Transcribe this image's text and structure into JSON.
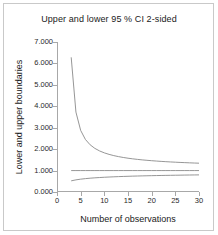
{
  "chart_data": {
    "type": "line",
    "title": "Upper and lower 95 % CI 2-sided",
    "xlabel": "Number of observations",
    "ylabel": "Lower and upper boundaries",
    "xlim": [
      0,
      30
    ],
    "ylim": [
      0,
      7
    ],
    "grid": false,
    "legend": "none",
    "xticks": [
      "0",
      "5",
      "10",
      "15",
      "20",
      "25",
      "30"
    ],
    "xtick_values": [
      0,
      5,
      10,
      15,
      20,
      25,
      30
    ],
    "yticks": [
      "0.000",
      "1.000",
      "2.000",
      "3.000",
      "4.000",
      "5.000",
      "6.000",
      "7.000"
    ],
    "ytick_values": [
      0,
      1,
      2,
      3,
      4,
      5,
      6,
      7
    ],
    "line_color": "#8a8a8a",
    "axis_color": "#a8a8a8",
    "x": [
      3,
      4,
      5,
      6,
      7,
      8,
      9,
      10,
      11,
      12,
      13,
      14,
      15,
      16,
      17,
      18,
      19,
      20,
      21,
      22,
      23,
      24,
      25,
      26,
      27,
      28,
      29,
      30
    ],
    "series": [
      {
        "name": "Upper boundary",
        "values": [
          6.285,
          3.729,
          2.874,
          2.453,
          2.202,
          2.035,
          1.916,
          1.826,
          1.755,
          1.698,
          1.651,
          1.611,
          1.577,
          1.548,
          1.522,
          1.499,
          1.479,
          1.461,
          1.444,
          1.429,
          1.415,
          1.403,
          1.391,
          1.38,
          1.37,
          1.361,
          1.352,
          1.344
        ]
      },
      {
        "name": "Reference line",
        "values": [
          1.0,
          1.0,
          1.0,
          1.0,
          1.0,
          1.0,
          1.0,
          1.0,
          1.0,
          1.0,
          1.0,
          1.0,
          1.0,
          1.0,
          1.0,
          1.0,
          1.0,
          1.0,
          1.0,
          1.0,
          1.0,
          1.0,
          1.0,
          1.0,
          1.0,
          1.0,
          1.0,
          1.0
        ]
      },
      {
        "name": "Lower boundary",
        "values": [
          0.521,
          0.566,
          0.599,
          0.624,
          0.644,
          0.661,
          0.675,
          0.688,
          0.699,
          0.709,
          0.718,
          0.726,
          0.733,
          0.74,
          0.746,
          0.752,
          0.757,
          0.762,
          0.767,
          0.771,
          0.775,
          0.779,
          0.783,
          0.786,
          0.79,
          0.793,
          0.796,
          0.799
        ]
      }
    ]
  }
}
